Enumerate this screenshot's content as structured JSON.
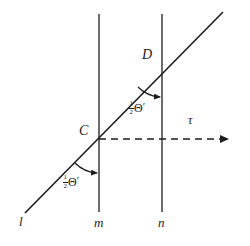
{
  "figure": {
    "type": "geometry-diagram",
    "background_color": "#ffffff",
    "stroke_color": "#1c1c1c",
    "canvas": {
      "width": 250,
      "height": 246
    }
  },
  "lines": {
    "transversal": {
      "name": "l",
      "label": "l",
      "label_x": 19,
      "label_y": 215,
      "x1": 25,
      "y1": 213,
      "x2": 223,
      "y2": 12,
      "style": "solid"
    },
    "vertical_m": {
      "name": "m",
      "label": "m",
      "label_x": 94,
      "label_y": 216,
      "x": 99,
      "y1": 14,
      "y2": 212,
      "style": "solid"
    },
    "vertical_n": {
      "name": "n",
      "label": "n",
      "label_x": 158,
      "label_y": 216,
      "x": 162,
      "y1": 14,
      "y2": 212,
      "style": "solid"
    },
    "tau_ray": {
      "name": "tau",
      "label": "τ",
      "label_x": 188,
      "label_y": 114,
      "x1": 99,
      "y1": 139,
      "x2": 228,
      "y2": 139,
      "style": "dashed",
      "arrow": "right",
      "arrow_tip_x": 236
    }
  },
  "points": [
    {
      "id": "C",
      "label": "C",
      "x": 99,
      "y": 139,
      "label_x": 79,
      "label_y": 124
    },
    {
      "id": "D",
      "label": "D",
      "x": 162,
      "y": 63,
      "label_x": 142,
      "label_y": 48
    }
  ],
  "angles": [
    {
      "id": "angle-at-C",
      "vertex": "C",
      "numerator": "1",
      "denominator": "2",
      "symbol": "Θ",
      "prime": "′",
      "label_x": 63,
      "label_y": 174,
      "arc": {
        "cx": 99,
        "cy": 139,
        "r": 34,
        "start_deg": 225,
        "end_deg": 270
      }
    },
    {
      "id": "angle-at-D",
      "vertex": "D",
      "numerator": "1",
      "denominator": "2",
      "symbol": "Θ",
      "prime": "′",
      "label_x": 129,
      "label_y": 100,
      "arc": {
        "cx": 162,
        "cy": 63,
        "r": 34,
        "start_deg": 225,
        "end_deg": 270
      }
    }
  ]
}
